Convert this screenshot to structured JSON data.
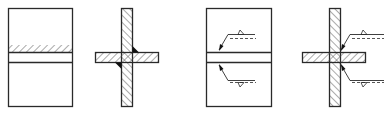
{
  "diagram": {
    "type": "weld-symbol-technical-drawing",
    "colors": {
      "stroke": "#2a2a2a",
      "hatch": "#555555",
      "weld": "#111111",
      "background": "#ffffff"
    },
    "figures": [
      {
        "id": "plan-view-hatched",
        "description": "Plan view of plate with hatched weld band"
      },
      {
        "id": "section-view-fillet",
        "description": "Cross section of T/cruciform joint with fillet welds"
      },
      {
        "id": "plan-view-symbols",
        "description": "Plan view with weld symbol leaders (arrow side / other side)"
      },
      {
        "id": "section-view-symbols",
        "description": "Cross section with fillet weld symbol leaders"
      }
    ]
  }
}
